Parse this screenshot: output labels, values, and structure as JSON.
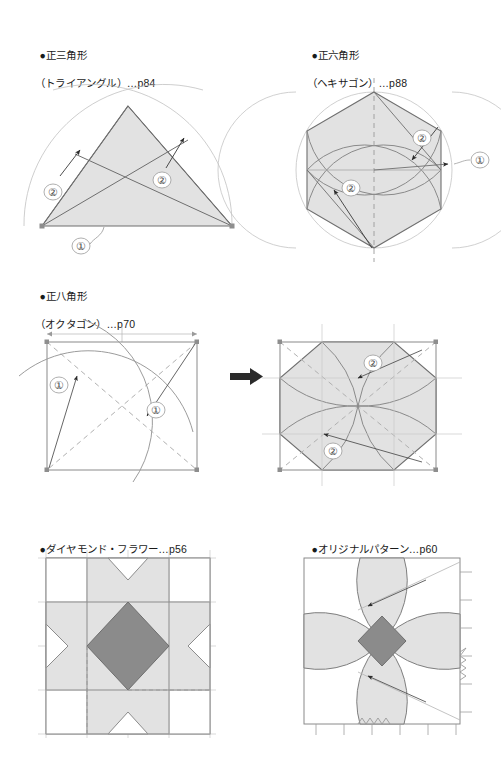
{
  "page": {
    "width": 501,
    "height": 769,
    "background": "#ffffff"
  },
  "colors": {
    "light_fill": "#e2e2e2",
    "dark_fill": "#8b8b8b",
    "outline": "#707070",
    "thin_line": "#b5b5b5",
    "dashed_line": "#9a9a9a",
    "text": "#1a1a1a",
    "arrow": "#2b2b2b"
  },
  "sections": [
    {
      "id": "triangle",
      "bullet": "●",
      "title_line1": "正三角形",
      "title_line2": "（トライアングル）…p84",
      "page_ref": "p84",
      "labels": [
        {
          "text": "②",
          "role": "step-2-left"
        },
        {
          "text": "②",
          "role": "step-2-right"
        },
        {
          "text": "①",
          "role": "step-1-base"
        }
      ]
    },
    {
      "id": "hexagon",
      "bullet": "●",
      "title_line1": "正六角形",
      "title_line2": "（ヘキサゴン）…p88",
      "page_ref": "p88",
      "labels": [
        {
          "text": "②",
          "role": "step-2-upper"
        },
        {
          "text": "②",
          "role": "step-2-lower"
        },
        {
          "text": "①",
          "role": "step-1-right"
        }
      ]
    },
    {
      "id": "octagon",
      "bullet": "●",
      "title_line1": "正八角形",
      "title_line2": "（オクタゴン）…p70",
      "page_ref": "p70",
      "labels": [
        {
          "text": "①",
          "role": "step-1-left"
        },
        {
          "text": "①",
          "role": "step-1-right"
        },
        {
          "text": "②",
          "role": "step-2-upper"
        },
        {
          "text": "②",
          "role": "step-2-lower"
        }
      ]
    },
    {
      "id": "diamond-flower",
      "bullet": "●",
      "title_line1": "ダイヤモンド・フラワー…p56",
      "title_line2": "",
      "page_ref": "p56",
      "labels": []
    },
    {
      "id": "original-pattern",
      "bullet": "●",
      "title_line1": "オリジナルパターン…p60",
      "title_line2": "",
      "page_ref": "p60",
      "labels": []
    }
  ]
}
